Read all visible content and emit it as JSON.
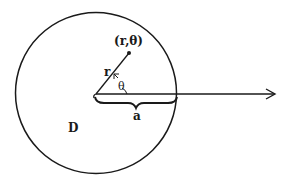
{
  "diagram": {
    "type": "polar-coordinates-disk",
    "colors": {
      "background": "#ffffff",
      "stroke": "#1a1a1a"
    },
    "labels": {
      "point": "(r,θ)",
      "radius": "r",
      "angle": "θ",
      "disk_radius": "a",
      "region": "D"
    },
    "geometry": {
      "center": [
        96,
        94
      ],
      "radius": 81,
      "point": [
        129,
        53
      ],
      "axis_end": [
        275,
        94
      ]
    }
  }
}
